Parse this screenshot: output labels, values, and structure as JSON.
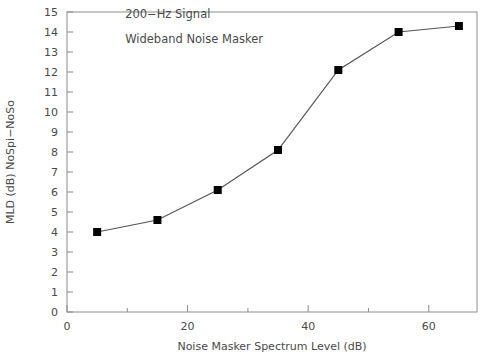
{
  "chart_data": {
    "type": "line",
    "title": "",
    "xlabel": "Noise Masker Spectrum Level (dB)",
    "ylabel": "MLD (dB) NoSpi−NoSo",
    "xlim": [
      0,
      68
    ],
    "ylim": [
      0,
      15
    ],
    "grid": false,
    "legend": null,
    "x_major_ticks": [
      0,
      20,
      40,
      60
    ],
    "x_major_tick_labels": [
      "0",
      "20",
      "40",
      "60"
    ],
    "x_minor_ticks": [
      10,
      30,
      50
    ],
    "y_major_ticks": [
      0,
      1,
      2,
      3,
      4,
      5,
      6,
      7,
      8,
      9,
      10,
      11,
      12,
      13,
      14,
      15
    ],
    "y_major_tick_labels": [
      "0",
      "1",
      "2",
      "3",
      "4",
      "5",
      "6",
      "7",
      "8",
      "9",
      "10",
      "11",
      "12",
      "13",
      "14",
      "15"
    ],
    "marker": "filled-square",
    "marker_color": "#000000",
    "line_color": "#555555",
    "series": [
      {
        "name": "MLD",
        "x": [
          5,
          15,
          25,
          35,
          45,
          55,
          65
        ],
        "values": [
          4.0,
          4.6,
          6.1,
          8.1,
          12.1,
          14.0,
          14.3
        ]
      }
    ],
    "annotations": [
      {
        "text": "200−Hz Signal",
        "x": 5,
        "y": 14.7
      },
      {
        "text": "Wideband Noise Masker",
        "x": 5,
        "y": 13.45
      }
    ]
  },
  "figure": {
    "background_color": "#ffffff",
    "frame_color": "#8c8c8c",
    "text_color": "#4a4a4a"
  }
}
